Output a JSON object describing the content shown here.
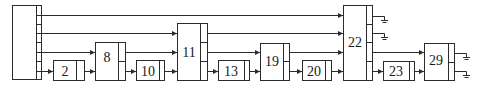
{
  "diagram": {
    "type": "block-diagram",
    "colors": {
      "stroke": "#2b2b2b",
      "background": "#ffffff",
      "text": "#1a1a1a"
    },
    "blocks": [
      {
        "id": "source",
        "label": "",
        "x": 12,
        "y": 5,
        "w": 29,
        "h": 74,
        "divider": 36
      },
      {
        "id": "b2",
        "label": "2",
        "x": 53,
        "y": 60,
        "w": 31,
        "h": 20,
        "divider": 76
      },
      {
        "id": "b8",
        "label": "8",
        "x": 95,
        "y": 42,
        "w": 30,
        "h": 38,
        "divider": 118
      },
      {
        "id": "b10",
        "label": "10",
        "x": 136,
        "y": 60,
        "w": 28,
        "h": 20,
        "divider": 159
      },
      {
        "id": "b11",
        "label": "11",
        "x": 177,
        "y": 23,
        "w": 30,
        "h": 57,
        "divider": 200
      },
      {
        "id": "b13",
        "label": "13",
        "x": 218,
        "y": 60,
        "w": 31,
        "h": 20,
        "divider": 244
      },
      {
        "id": "b19",
        "label": "19",
        "x": 260,
        "y": 43,
        "w": 29,
        "h": 37,
        "divider": 283
      },
      {
        "id": "b20",
        "label": "20",
        "x": 302,
        "y": 60,
        "w": 29,
        "h": 20,
        "divider": 325
      },
      {
        "id": "b22",
        "label": "22",
        "x": 343,
        "y": 5,
        "w": 29,
        "h": 75,
        "divider": 366
      },
      {
        "id": "b23",
        "label": "23",
        "x": 383,
        "y": 61,
        "w": 31,
        "h": 19,
        "divider": 409
      },
      {
        "id": "b29",
        "label": "29",
        "x": 424,
        "y": 43,
        "w": 30,
        "h": 37,
        "divider": 448
      }
    ],
    "connections": [
      {
        "from": "source",
        "to": "b22",
        "y": 15
      },
      {
        "from": "source",
        "to": "b11",
        "y": 33
      },
      {
        "from": "source",
        "to": "b8",
        "y": 52
      },
      {
        "from": "source",
        "to": "b2",
        "y": 71
      },
      {
        "from": "b2",
        "to": "b8",
        "y": 71
      },
      {
        "from": "b8",
        "to": "b11",
        "y": 52
      },
      {
        "from": "b8",
        "to": "b10",
        "y": 71
      },
      {
        "from": "b10",
        "to": "b11",
        "y": 71
      },
      {
        "from": "b11",
        "to": "b22",
        "y": 33
      },
      {
        "from": "b11",
        "to": "b19",
        "y": 52
      },
      {
        "from": "b11",
        "to": "b13",
        "y": 71
      },
      {
        "from": "b13",
        "to": "b19",
        "y": 71
      },
      {
        "from": "b19",
        "to": "b22",
        "y": 52
      },
      {
        "from": "b19",
        "to": "b20",
        "y": 71
      },
      {
        "from": "b20",
        "to": "b22",
        "y": 71
      },
      {
        "from": "b22",
        "to": "b29",
        "y": 52
      },
      {
        "from": "b22",
        "to": "b23",
        "y": 71
      },
      {
        "from": "b23",
        "to": "b29",
        "y": 71
      }
    ],
    "terminals": [
      {
        "from": "b22",
        "y": 19,
        "x_end": 385,
        "symbol": "ground-terminal"
      },
      {
        "from": "b22",
        "y": 34,
        "x_end": 385,
        "symbol": "ground-terminal"
      },
      {
        "from": "b29",
        "y": 54,
        "x_end": 467,
        "symbol": "ground-terminal"
      },
      {
        "from": "b29",
        "y": 71,
        "x_end": 467,
        "symbol": "ground-terminal"
      }
    ]
  },
  "labels": {
    "b2": "2",
    "b8": "8",
    "b10": "10",
    "b11": "11",
    "b13": "13",
    "b19": "19",
    "b20": "20",
    "b22": "22",
    "b23": "23",
    "b29": "29"
  }
}
